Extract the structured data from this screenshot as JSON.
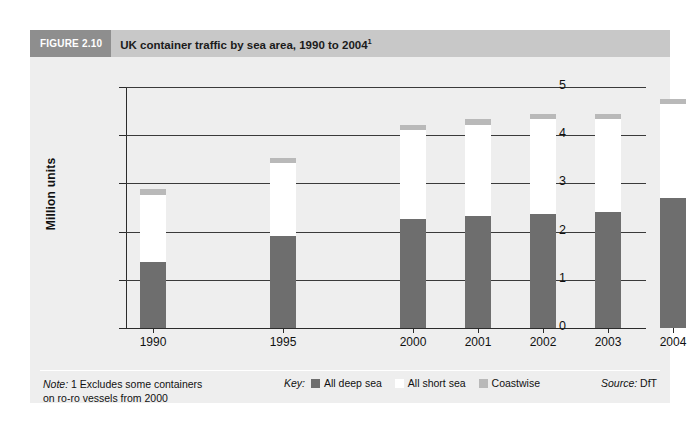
{
  "figure": {
    "number_label": "FIGURE 2.10",
    "title": "UK container traffic by sea area, 1990 to 2004",
    "title_superscript": "1"
  },
  "footer": {
    "note_label": "Note:",
    "note_line1": " 1 Excludes some containers",
    "note_line2": "on ro-ro vessels from 2000",
    "key_label": "Key:",
    "source_label": "Source:",
    "source_value": " DfT"
  },
  "colors": {
    "deep_sea": "#6e6e6e",
    "short_sea": "#ffffff",
    "coastwise": "#b9b9b9",
    "panel_background": "#eeeeee",
    "title_bar": "#c8c8c8",
    "figure_number_box": "#8e8e8e"
  },
  "chart_data": {
    "type": "bar",
    "stacked": true,
    "title": "UK container traffic by sea area, 1990 to 2004",
    "xlabel": "",
    "ylabel": "Million units",
    "ylim": [
      0,
      5
    ],
    "yticks": [
      "0",
      "1",
      "2",
      "3",
      "4",
      "5"
    ],
    "grid": true,
    "legend_position": "bottom",
    "categories": [
      "1990",
      "1995",
      "2000",
      "2001",
      "2002",
      "2003",
      "2004"
    ],
    "series": [
      {
        "name": "All deep sea",
        "values": [
          1.37,
          1.9,
          2.26,
          2.32,
          2.36,
          2.4,
          2.69
        ]
      },
      {
        "name": "All short sea",
        "values": [
          1.38,
          1.53,
          1.85,
          1.9,
          1.97,
          1.93,
          1.96
        ]
      },
      {
        "name": "Coastwise",
        "values": [
          0.13,
          0.1,
          0.11,
          0.11,
          0.11,
          0.11,
          0.11
        ]
      }
    ],
    "totals": [
      2.88,
      3.53,
      4.22,
      4.33,
      4.44,
      4.44,
      4.76
    ]
  }
}
